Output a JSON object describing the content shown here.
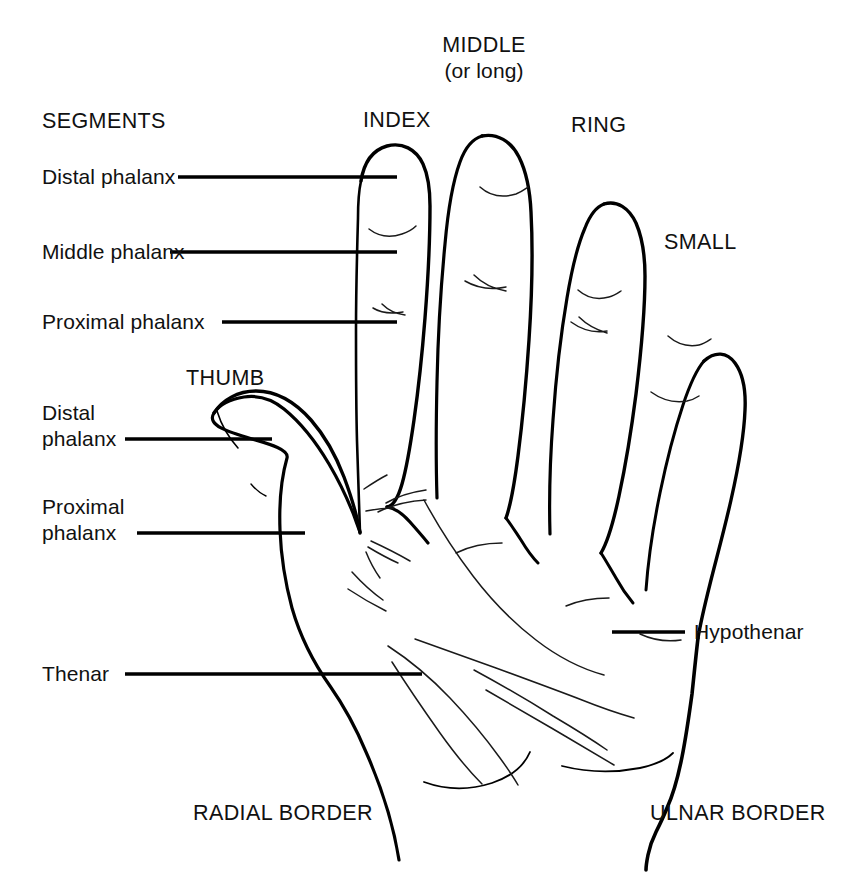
{
  "diagram": {
    "title_text": "SEGMENTS",
    "stroke_color": "#000000",
    "background_color": "#ffffff",
    "labels": {
      "segments_heading": "SEGMENTS",
      "index_distal_phalanx": "Distal phalanx",
      "index_middle_phalanx": "Middle phalanx",
      "index_proximal_phalanx": "Proximal phalanx",
      "thumb_name": "THUMB",
      "thumb_distal_phalanx": "Distal\nphalanx",
      "thumb_proximal_phalanx": "Proximal\nphalanx",
      "thenar": "Thenar",
      "hypothenar": "Hypothenar",
      "index_finger": "INDEX",
      "middle_finger": "MIDDLE",
      "middle_finger_alt": "(or long)",
      "ring_finger": "RING",
      "small_finger": "SMALL",
      "radial_border": "RADIAL BORDER",
      "ulnar_border": "ULNAR BORDER"
    }
  }
}
